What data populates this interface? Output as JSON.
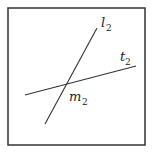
{
  "diagram": {
    "frame": {
      "x": 8,
      "y": 8,
      "width": 137,
      "height": 137,
      "stroke": "#333333"
    },
    "lines": [
      {
        "name": "l",
        "subscript": "2",
        "x1": 45,
        "y1": 124,
        "x2": 97,
        "y2": 28
      },
      {
        "name": "t",
        "subscript": "2",
        "x1": 25,
        "y1": 95,
        "x2": 136,
        "y2": 66
      }
    ],
    "labels": {
      "l_label": {
        "base": "l",
        "sub": "2"
      },
      "t_label": {
        "base": "t",
        "sub": "2"
      },
      "m_label": {
        "base": "m",
        "sub": "2"
      }
    },
    "intersection": {
      "x": 66,
      "y": 84
    }
  }
}
